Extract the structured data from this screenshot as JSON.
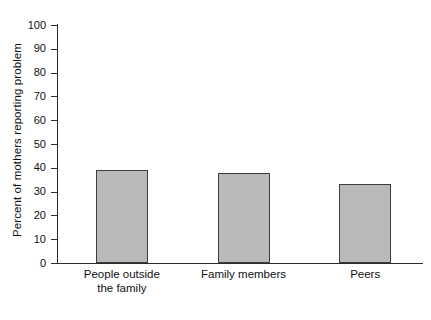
{
  "chart_data": {
    "type": "bar",
    "title": "",
    "subtitle": "",
    "xlabel": "",
    "ylabel": "Percent of mothers reporting problem",
    "categories": [
      "People outside the family",
      "Family members",
      "Peers"
    ],
    "category_lines": [
      [
        "People outside",
        "the family"
      ],
      [
        "Family members"
      ],
      [
        "Peers"
      ]
    ],
    "values": [
      39,
      38,
      33
    ],
    "ylim": [
      0,
      100
    ],
    "ytick_step": 10,
    "yticks": [
      0,
      10,
      20,
      30,
      40,
      50,
      60,
      70,
      80,
      90,
      100
    ],
    "ytick_labels": [
      "0",
      "10",
      "20",
      "30",
      "40",
      "50",
      "60",
      "70",
      "80",
      "90",
      "100"
    ],
    "grid": false,
    "legend": false,
    "legend_position": "none",
    "bar_fill_color": "#b9b9b9",
    "bar_edge_color": "#3d3d3d",
    "axis_color": "#2b2b2b",
    "background_color": "#ffffff"
  }
}
